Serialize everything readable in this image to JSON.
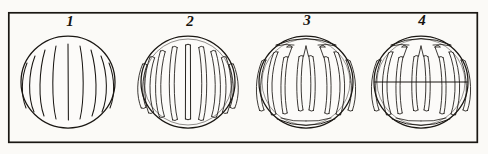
{
  "plate": {
    "kind": "scientific-illustration-plate",
    "subject": "stages of cell division (karyokinesis) chromosome spindle figures",
    "style": "antique line engraving",
    "background_color": "#fbfaf7",
    "ink_color": "#1a1713",
    "frame": {
      "name": "plate-border",
      "x": 8,
      "y": 12,
      "width": 470,
      "height": 131,
      "stroke_color": "#1a1713",
      "stroke_width": 1.6
    },
    "figures": [
      {
        "label": "1",
        "name": "figure-1-spireme",
        "center_x": 68,
        "center_y": 82,
        "radius_x": 47,
        "radius_y": 46,
        "description": "cell outline with fine thin longitudinal threads (thin chromatin filaments)",
        "strand_style": "thin-single-line",
        "strand_count": 9,
        "has_spindle_poles": false,
        "has_equatorial_line": false
      },
      {
        "label": "2",
        "name": "figure-2-thick-chromosomes",
        "center_x": 188,
        "center_y": 82,
        "radius_x": 47,
        "radius_y": 46,
        "description": "cell outline with thickened hollow double-outlined chromosome strands",
        "strand_style": "thick-hollow-double-outline",
        "strand_count": 9,
        "has_spindle_poles": false,
        "has_equatorial_line": false
      },
      {
        "label": "3",
        "name": "figure-3-spindle-formed",
        "center_x": 306,
        "center_y": 82,
        "radius_x": 47,
        "radius_y": 46,
        "description": "chromosomes looped into U/V shapes converging at top and bottom spindle poles",
        "strand_style": "looped-u-shaped-hollow",
        "strand_count": 9,
        "has_spindle_poles": true,
        "has_equatorial_line": false
      },
      {
        "label": "4",
        "name": "figure-4-equatorial-plate",
        "center_x": 421,
        "center_y": 82,
        "radius_x": 47,
        "radius_y": 46,
        "description": "same as figure 3 with a horizontal equatorial division line across the cell",
        "strand_style": "looped-u-shaped-hollow",
        "strand_count": 9,
        "has_spindle_poles": true,
        "has_equatorial_line": true,
        "equatorial_line_y": 82
      }
    ]
  }
}
